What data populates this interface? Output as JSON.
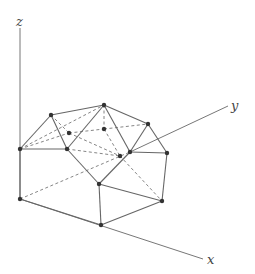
{
  "diagram": {
    "type": "3d-polyhedron",
    "axes": {
      "x": {
        "label": "x",
        "from": [
          20,
          199
        ],
        "to": [
          203,
          259
        ],
        "label_pos": [
          207,
          264
        ]
      },
      "y": {
        "label": "y",
        "from": [
          130,
          152
        ],
        "to": [
          228,
          106
        ],
        "label_pos": [
          231,
          110
        ]
      },
      "y_hidden": {
        "from": [
          20,
          199
        ],
        "to": [
          130,
          152
        ]
      },
      "z": {
        "label": "z",
        "from": [
          20,
          199
        ],
        "to": [
          20,
          28
        ],
        "label_pos": [
          16,
          26
        ]
      }
    },
    "vertices": {
      "A": [
        51,
        115
      ],
      "B": [
        104,
        105
      ],
      "C": [
        148,
        124
      ],
      "D": [
        20,
        149
      ],
      "E": [
        67,
        149
      ],
      "F": [
        130,
        152
      ],
      "G": [
        167,
        153
      ],
      "H1": [
        69,
        133
      ],
      "H2": [
        104,
        129
      ],
      "H3": [
        120,
        156
      ],
      "I": [
        99,
        184
      ],
      "J": [
        20,
        199
      ],
      "K": [
        162,
        201
      ],
      "L": [
        101,
        225
      ]
    },
    "edges_visible": [
      [
        "A",
        "B"
      ],
      [
        "B",
        "C"
      ],
      [
        "A",
        "D"
      ],
      [
        "A",
        "E"
      ],
      [
        "D",
        "E"
      ],
      [
        "B",
        "E"
      ],
      [
        "B",
        "F"
      ],
      [
        "C",
        "F"
      ],
      [
        "C",
        "G"
      ],
      [
        "F",
        "G"
      ],
      [
        "E",
        "I"
      ],
      [
        "F",
        "I"
      ],
      [
        "G",
        "K"
      ],
      [
        "I",
        "K"
      ],
      [
        "I",
        "L"
      ],
      [
        "L",
        "K"
      ],
      [
        "D",
        "J"
      ],
      [
        "J",
        "L"
      ]
    ],
    "edges_hidden": [
      [
        "D",
        "H1"
      ],
      [
        "H1",
        "H2"
      ],
      [
        "H2",
        "C"
      ],
      [
        "B",
        "H2"
      ],
      [
        "D",
        "B"
      ],
      [
        "H1",
        "H3"
      ],
      [
        "H2",
        "H3"
      ],
      [
        "H3",
        "K"
      ],
      [
        "A",
        "H1"
      ],
      [
        "E",
        "H3"
      ]
    ]
  }
}
